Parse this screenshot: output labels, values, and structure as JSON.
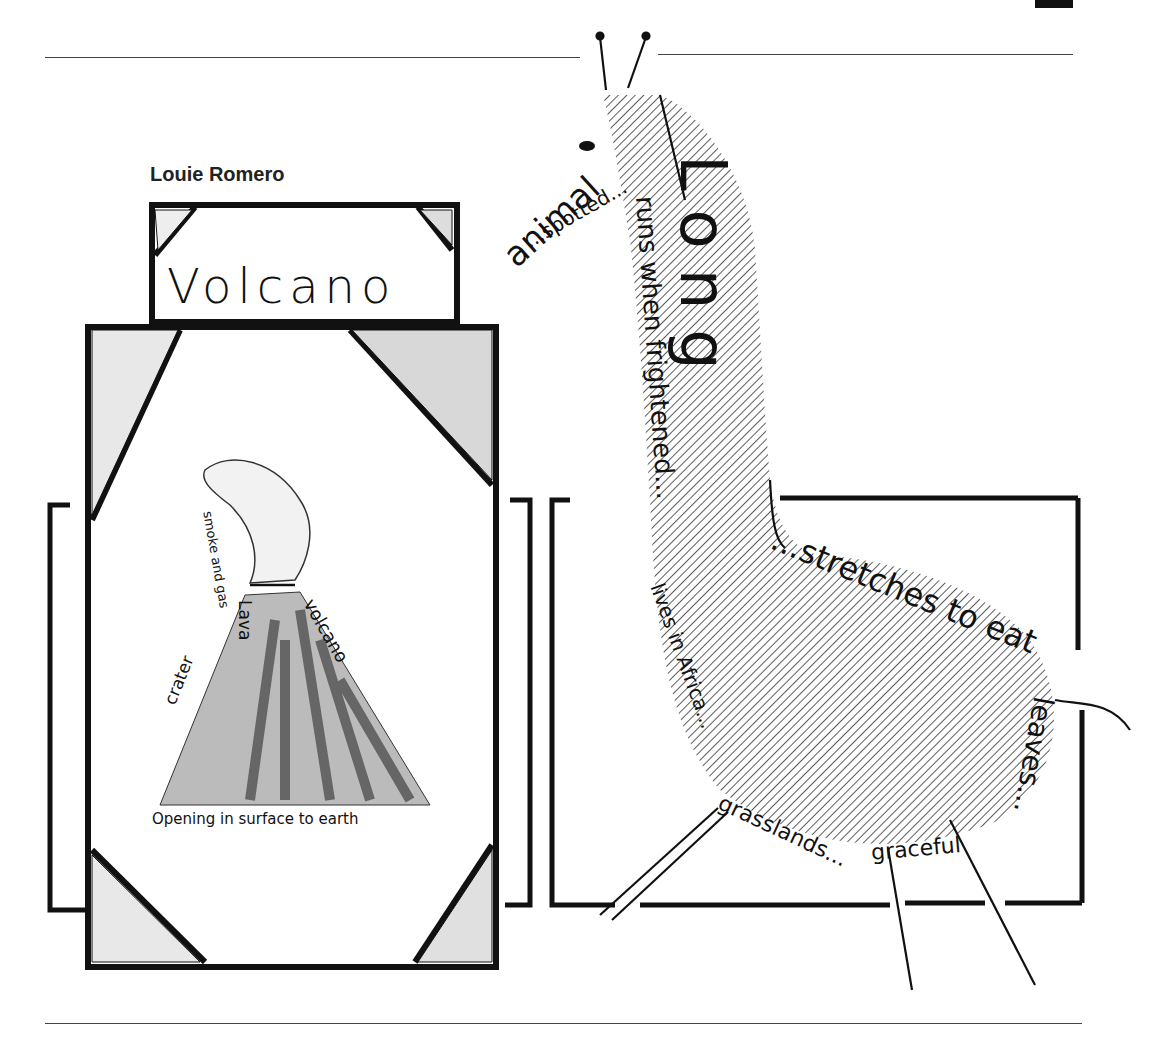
{
  "header": {
    "section_tab": "LESSONS"
  },
  "author": "Louie Romero",
  "volcano_poem": {
    "title": "Volcano",
    "smoke_words": "smoke and gas",
    "side_words_left": "crater",
    "side_words_center": "Lava",
    "side_words_right": "volcano",
    "base_caption": "Opening in surface to earth"
  },
  "giraffe_poem": {
    "word_long": "Long",
    "phrases": [
      "animal",
      "...spotted...",
      "runs when frightened...",
      "lives in Africa...",
      "grasslands...",
      "graceful",
      "...stretches to eat",
      "leaves..."
    ]
  },
  "colors": {
    "ink": "#111111",
    "paper": "#ffffff",
    "rule": "#444444"
  }
}
